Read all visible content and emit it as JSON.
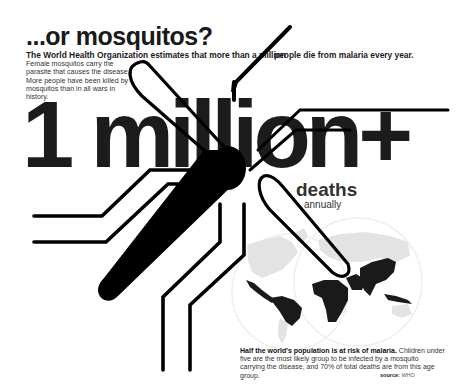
{
  "header": {
    "title": "...or mosquitos?",
    "subtitle_part1": "The World Health Organization estimates that more than a million",
    "subtitle_part2": "people die from malaria every year."
  },
  "intro": {
    "text": "Female mosquitos carry the parasite that causes the disease. More people have been killed by mosquitos than in all wars in history."
  },
  "stat": {
    "value": "1 million+",
    "label": "deaths",
    "sublabel": "annually"
  },
  "map": {
    "description": "world map highlighting malaria-risk regions",
    "highlight_color": "#1a1a1a",
    "base_color": "#e3e3e3",
    "outline_color": "#eeeeee"
  },
  "footnote": {
    "bold": "Half the world's population is at risk of malaria.",
    "text": " Children under five are the most likely group to be infected by a mosquito carrying the disease, and 70% of total deaths are from this age group."
  },
  "source": {
    "label": "source:",
    "value": "WHO"
  },
  "colors": {
    "ink": "#1a1a1a",
    "background": "#ffffff"
  }
}
